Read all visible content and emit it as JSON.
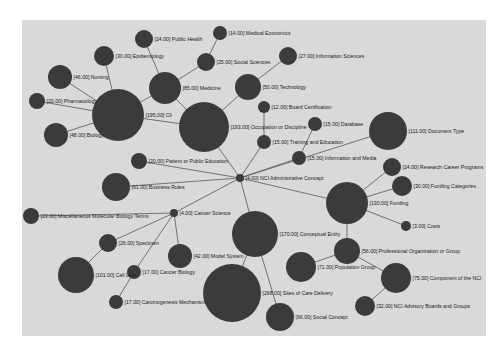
{
  "graph": {
    "background_color": "#d9d9d9",
    "node_color": "#3b3b3b",
    "edge_color": "#555555",
    "nodes": [
      {
        "id": "nci_admin",
        "label": "[4.00] NCI Administrative Concept",
        "value": 4.0,
        "x": 240,
        "y": 178,
        "r": 4
      },
      {
        "id": "cancer_science",
        "label": "[4.00] Cancer Science",
        "value": 4.0,
        "x": 174,
        "y": 213,
        "r": 4
      },
      {
        "id": "clinical",
        "label": "[195.00] Cli",
        "value": 195.0,
        "x": 118,
        "y": 115,
        "r": 26
      },
      {
        "id": "occupation",
        "label": "[193.00] Occupation or Discipline",
        "value": 193.0,
        "x": 204,
        "y": 127,
        "r": 25
      },
      {
        "id": "medicine",
        "label": "[85.00] Medicine",
        "value": 85.0,
        "x": 165,
        "y": 88,
        "r": 16
      },
      {
        "id": "nursing",
        "label": "[46.00] Nursing",
        "value": 46.0,
        "x": 60,
        "y": 77,
        "r": 12
      },
      {
        "id": "epidemiology",
        "label": "[30.00] Epidemiology",
        "value": 30.0,
        "x": 104,
        "y": 56,
        "r": 10
      },
      {
        "id": "public_health",
        "label": "[24.00] Public Health",
        "value": 24.0,
        "x": 144,
        "y": 39,
        "r": 9
      },
      {
        "id": "pharmacology",
        "label": "[20.00] Pharmacology",
        "value": 20.0,
        "x": 37,
        "y": 101,
        "r": 8
      },
      {
        "id": "biology",
        "label": "[48.00] Biology",
        "value": 48.0,
        "x": 56,
        "y": 135,
        "r": 12
      },
      {
        "id": "social_sciences",
        "label": "[25.00] Social Sciences",
        "value": 25.0,
        "x": 206,
        "y": 62,
        "r": 9
      },
      {
        "id": "medical_economics",
        "label": "[14.00] Medical Economics",
        "value": 14.0,
        "x": 220,
        "y": 33,
        "r": 7
      },
      {
        "id": "information_sciences",
        "label": "[27.00] Information Sciences",
        "value": 27.0,
        "x": 288,
        "y": 56,
        "r": 9
      },
      {
        "id": "technology",
        "label": "[50.00] Technology",
        "value": 50.0,
        "x": 248,
        "y": 87,
        "r": 13
      },
      {
        "id": "board_certification",
        "label": "[12.00] Board Certification",
        "value": 12.0,
        "x": 264,
        "y": 107,
        "r": 6
      },
      {
        "id": "training_education",
        "label": "[15.00] Training and Education",
        "value": 15.0,
        "x": 264,
        "y": 142,
        "r": 7
      },
      {
        "id": "database",
        "label": "[15.00] Database",
        "value": 15.0,
        "x": 315,
        "y": 124,
        "r": 7
      },
      {
        "id": "information_media",
        "label": "[15.00] Information and Media",
        "value": 15.0,
        "x": 299,
        "y": 158,
        "r": 7
      },
      {
        "id": "document_type",
        "label": "[111.00] Document Type",
        "value": 111.0,
        "x": 388,
        "y": 131,
        "r": 19
      },
      {
        "id": "research_career",
        "label": "[24.00] Research Career Programs",
        "value": 24.0,
        "x": 392,
        "y": 167,
        "r": 9
      },
      {
        "id": "funding_categories",
        "label": "[30.00] Funding Categories",
        "value": 30.0,
        "x": 402,
        "y": 186,
        "r": 10
      },
      {
        "id": "funding",
        "label": "[130.00] Funding",
        "value": 130.0,
        "x": 347,
        "y": 203,
        "r": 21
      },
      {
        "id": "costs",
        "label": "[3.00] Costs",
        "value": 3.0,
        "x": 406,
        "y": 226,
        "r": 5
      },
      {
        "id": "patient_education",
        "label": "[20.00] Patient or Public Education",
        "value": 20.0,
        "x": 139,
        "y": 161,
        "r": 8
      },
      {
        "id": "business_rules",
        "label": "[61.00] Business Rules",
        "value": 61.0,
        "x": 116,
        "y": 187,
        "r": 14
      },
      {
        "id": "misc_molecular",
        "label": "[23.00] Miscellaneous Molecular Biology Terms",
        "value": 23.0,
        "x": 31,
        "y": 216,
        "r": 8
      },
      {
        "id": "specimen",
        "label": "[26.00] Specimen",
        "value": 26.0,
        "x": 108,
        "y": 243,
        "r": 9
      },
      {
        "id": "cell_line",
        "label": "[101.00] Cell Line",
        "value": 101.0,
        "x": 76,
        "y": 275,
        "r": 18
      },
      {
        "id": "cancer_biology",
        "label": "[17.00] Cancer Biology",
        "value": 17.0,
        "x": 134,
        "y": 272,
        "r": 7
      },
      {
        "id": "carcinogenesis",
        "label": "[17.00] Carcinogenesis Mechanism",
        "value": 17.0,
        "x": 116,
        "y": 302,
        "r": 7
      },
      {
        "id": "model_system",
        "label": "[42.00] Model System",
        "value": 42.0,
        "x": 180,
        "y": 256,
        "r": 12
      },
      {
        "id": "conceptual_entity",
        "label": "[170.00] Conceptual Entity",
        "value": 170.0,
        "x": 255,
        "y": 234,
        "r": 23
      },
      {
        "id": "sites_of_care",
        "label": "[268.00] Sites of Care Delivery",
        "value": 268.0,
        "x": 232,
        "y": 293,
        "r": 29
      },
      {
        "id": "social_concept",
        "label": "[66.00] Social Concept",
        "value": 66.0,
        "x": 280,
        "y": 317,
        "r": 14
      },
      {
        "id": "population_group",
        "label": "[71.00] Population Group",
        "value": 71.0,
        "x": 301,
        "y": 267,
        "r": 15
      },
      {
        "id": "professional_org",
        "label": "[56.00] Professional Organization or Group",
        "value": 56.0,
        "x": 347,
        "y": 251,
        "r": 13
      },
      {
        "id": "component_nci",
        "label": "[75.00] Component of the NCI",
        "value": 75.0,
        "x": 396,
        "y": 278,
        "r": 15
      },
      {
        "id": "nci_advisory",
        "label": "[32.00] NCI Advisory Boards and Groups",
        "value": 32.0,
        "x": 365,
        "y": 306,
        "r": 10
      }
    ],
    "edges": [
      [
        "nci_admin",
        "occupation"
      ],
      [
        "nci_admin",
        "training_education"
      ],
      [
        "nci_admin",
        "information_media"
      ],
      [
        "nci_admin",
        "patient_education"
      ],
      [
        "nci_admin",
        "business_rules"
      ],
      [
        "nci_admin",
        "cancer_science"
      ],
      [
        "nci_admin",
        "conceptual_entity"
      ],
      [
        "nci_admin",
        "funding"
      ],
      [
        "nci_admin",
        "document_type"
      ],
      [
        "occupation",
        "clinical"
      ],
      [
        "occupation",
        "medicine"
      ],
      [
        "occupation",
        "technology"
      ],
      [
        "clinical",
        "nursing"
      ],
      [
        "clinical",
        "epidemiology"
      ],
      [
        "clinical",
        "pharmacology"
      ],
      [
        "clinical",
        "biology"
      ],
      [
        "clinical",
        "medicine"
      ],
      [
        "medicine",
        "public_health"
      ],
      [
        "medicine",
        "social_sciences"
      ],
      [
        "social_sciences",
        "medical_economics"
      ],
      [
        "technology",
        "information_sciences"
      ],
      [
        "training_education",
        "board_certification"
      ],
      [
        "information_media",
        "database"
      ],
      [
        "funding",
        "research_career"
      ],
      [
        "funding",
        "funding_categories"
      ],
      [
        "funding",
        "costs"
      ],
      [
        "funding",
        "professional_org"
      ],
      [
        "cancer_science",
        "misc_molecular"
      ],
      [
        "cancer_science",
        "specimen"
      ],
      [
        "cancer_science",
        "cancer_biology"
      ],
      [
        "cancer_science",
        "model_system"
      ],
      [
        "specimen",
        "cell_line"
      ],
      [
        "cancer_biology",
        "carcinogenesis"
      ],
      [
        "conceptual_entity",
        "sites_of_care"
      ],
      [
        "conceptual_entity",
        "social_concept"
      ],
      [
        "professional_org",
        "population_group"
      ],
      [
        "professional_org",
        "component_nci"
      ],
      [
        "component_nci",
        "nci_advisory"
      ]
    ]
  }
}
